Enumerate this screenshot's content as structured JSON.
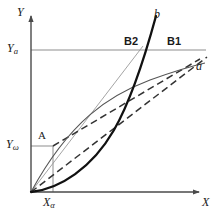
{
  "figure": {
    "title": "",
    "background": "#ffffff",
    "axes": {
      "x_axis_label": "X",
      "y_axis_label": "Y",
      "axis_color": "#5a5a5a",
      "origin_px": [
        31,
        192
      ]
    },
    "gridlines": [
      {
        "name": "Ya-horizontal",
        "label": "Y",
        "sub": "a",
        "y_px": 50,
        "color": "#7a7a7a"
      },
      {
        "name": "Yw-horizontal",
        "label": "Y",
        "sub": "ω",
        "y_px": 146,
        "color": "#7a7a7a"
      },
      {
        "name": "Xa-vertical",
        "label": "X",
        "sub": "α",
        "x_px": 53,
        "color": "#7a7a7a"
      }
    ],
    "tick_labels": {
      "y_upper": "Y",
      "y_upper_sub": "a",
      "y_lower": "Y",
      "y_lower_sub": "ω",
      "x_tick": "X",
      "x_tick_sub": "α"
    },
    "points": [
      {
        "name": "A",
        "label": "A",
        "x_px": 53,
        "y_px": 146,
        "style": "plain"
      },
      {
        "name": "B2",
        "label": "B2",
        "x_px": 137,
        "y_px": 50,
        "style": "bold"
      },
      {
        "name": "B1",
        "label": "B1",
        "x_px": 180,
        "y_px": 50,
        "style": "bold"
      }
    ],
    "curves": [
      {
        "name": "curve-a",
        "label": "a",
        "style": "solid-thin",
        "color": "#4a4a4a",
        "description": "concave-down saturating curve from origin to upper right"
      },
      {
        "name": "curve-b",
        "label": "b",
        "style": "solid-thick",
        "color": "#111111",
        "description": "convex-up exponential curve from origin steeply rising"
      },
      {
        "name": "chord-origin-B2",
        "label": "",
        "style": "solid-thin",
        "color": "#8a8a8a",
        "description": "straight thin line from origin through B2"
      },
      {
        "name": "chord-origin-dashed",
        "label": "",
        "style": "dashed",
        "color": "#3a3a3a",
        "description": "dashed line from origin to B1 through intersection"
      },
      {
        "name": "chord-A-dashed",
        "label": "",
        "style": "dashed",
        "color": "#3a3a3a",
        "description": "dashed line from point A toward B1"
      }
    ],
    "intersection_px": [
      132,
      88
    ]
  }
}
